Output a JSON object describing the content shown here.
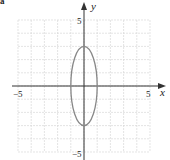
{
  "part_label": "a",
  "chart_data": {
    "type": "line",
    "title": "",
    "xlabel": "x",
    "ylabel": "y",
    "xlim": [
      -5,
      5
    ],
    "ylim": [
      -5,
      5
    ],
    "grid": true,
    "grid_step": 1,
    "x_ticks_labeled": [
      -5,
      5
    ],
    "y_ticks_labeled": [
      5,
      -5
    ],
    "tick_labels": {
      "x_neg": "−5",
      "x_pos": "5",
      "y_pos": "5",
      "y_neg": "−5"
    },
    "series": [
      {
        "name": "ellipse",
        "shape": "ellipse",
        "center": [
          0,
          0
        ],
        "semi_axis_x": 1,
        "semi_axis_y": 3,
        "equation": "x^2/1 + y^2/9 = 1",
        "color": "#888888"
      }
    ],
    "colors": {
      "grid": "#d9d9d9",
      "axis": "#333333",
      "curve": "#888888"
    }
  }
}
